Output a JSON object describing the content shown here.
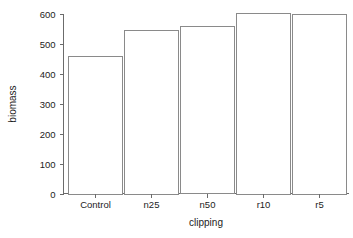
{
  "chart_data": {
    "type": "bar",
    "title": "",
    "subtitle": "",
    "xlabel": "clipping",
    "ylabel": "biomass",
    "categories": [
      "Control",
      "n25",
      "n50",
      "r10",
      "r5"
    ],
    "values": [
      460,
      545,
      558,
      603,
      600
    ],
    "series": [
      {
        "name": "biomass",
        "values": [
          460,
          545,
          558,
          603,
          600
        ]
      }
    ],
    "ylim": [
      0,
      600
    ],
    "yticks": [
      0,
      100,
      200,
      300,
      400,
      500,
      600
    ],
    "ytick_labels": [
      "0",
      "100",
      "200",
      "300",
      "400",
      "500",
      "600"
    ],
    "xtick_labels": [
      "Control",
      "n25",
      "n50",
      "r10",
      "r5"
    ],
    "grid": false,
    "legend": false,
    "legend_position": "none",
    "bar_fill_color": "#ffffff",
    "bar_edge_color": "#8a8a8a",
    "axis_color": "#6b6b6b",
    "background_color": "#ffffff",
    "text_color": "#1c1c1c"
  }
}
